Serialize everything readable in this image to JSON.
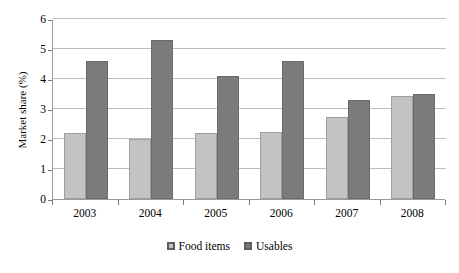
{
  "chart_data": {
    "type": "bar",
    "title": "",
    "subtitle": "",
    "xlabel": "",
    "ylabel": "Market share (%)",
    "categories": [
      "2003",
      "2004",
      "2005",
      "2006",
      "2007",
      "2008"
    ],
    "series": [
      {
        "name": "Food items",
        "color": "#c3c3c3",
        "values": [
          2.2,
          2.0,
          2.2,
          2.25,
          2.75,
          3.42
        ]
      },
      {
        "name": "Usables",
        "color": "#7b7b7b",
        "values": [
          4.6,
          5.3,
          4.1,
          4.6,
          3.3,
          3.5
        ]
      }
    ],
    "ylim": [
      0,
      6
    ],
    "ytick_labels": [
      "0",
      "1",
      "2",
      "3",
      "4",
      "5",
      "6"
    ],
    "ytick_values": [
      0,
      1,
      2,
      3,
      4,
      5,
      6
    ],
    "grid": "horizontal",
    "legend_position": "bottom",
    "legend_entries": [
      "Food items",
      "Usables"
    ]
  },
  "axis": {
    "y_title": "Market share (%)"
  },
  "colors": {
    "series_light": "#c3c3c3",
    "series_dark": "#7b7b7b",
    "gridline": "#bdbdbd",
    "axis": "#9a9a9a",
    "background": "#ffffff",
    "text": "#000000"
  }
}
